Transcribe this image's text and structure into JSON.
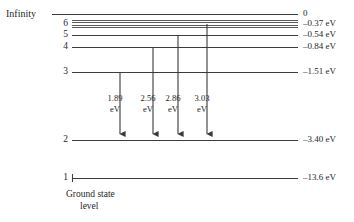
{
  "diagram": {
    "infinity_label": "Infinity",
    "ground_state_label": "Ground state",
    "ground_state_label_line2": "level",
    "line_color": "#3d3d3d",
    "text_color": "#262626",
    "background": "#ffffff",
    "levels": [
      {
        "id": "infinity",
        "number": "",
        "energy": "0",
        "y": 14,
        "x_start": 52,
        "x_end": 298
      },
      {
        "id": "n6",
        "number": "6",
        "energy": "–0.37 eV",
        "y": 24,
        "x_start": 72,
        "x_end": 298
      },
      {
        "id": "n5",
        "number": "5",
        "energy": "–0.54 eV",
        "y": 35,
        "x_start": 72,
        "x_end": 298
      },
      {
        "id": "n4",
        "number": "4",
        "energy": "–0.84 eV",
        "y": 47,
        "x_start": 72,
        "x_end": 298
      },
      {
        "id": "n3",
        "number": "3",
        "energy": "–1.51 eV",
        "y": 72,
        "x_start": 72,
        "x_end": 298
      },
      {
        "id": "n2",
        "number": "2",
        "energy": "–3.40 eV",
        "y": 140,
        "x_start": 72,
        "x_end": 298
      },
      {
        "id": "n1",
        "number": "1",
        "energy": "–13.6 eV",
        "y": 178,
        "x_start": 72,
        "x_end": 298
      }
    ],
    "converging_lines_y": [
      21,
      23,
      25,
      27
    ],
    "transitions": [
      {
        "id": "n3-to-n2",
        "from_level": "3",
        "to_level": "2",
        "energy": "1.89",
        "unit": "eV",
        "x": 120,
        "y_start": 72,
        "y_end": 140,
        "label_x": 110,
        "label_y": 93
      },
      {
        "id": "n4-to-n2",
        "from_level": "4",
        "to_level": "2",
        "energy": "2.56",
        "unit": "eV",
        "x": 153,
        "y_start": 47,
        "y_end": 140,
        "label_x": 143,
        "label_y": 93
      },
      {
        "id": "n5-to-n2",
        "from_level": "5",
        "to_level": "2",
        "energy": "2.86",
        "unit": "eV",
        "x": 178,
        "y_start": 35,
        "y_end": 140,
        "label_x": 168,
        "label_y": 93
      },
      {
        "id": "n6-to-n2",
        "from_level": "6",
        "to_level": "2",
        "energy": "3.03",
        "unit": "eV",
        "x": 207,
        "y_start": 24,
        "y_end": 140,
        "label_x": 197,
        "label_y": 93
      }
    ]
  }
}
